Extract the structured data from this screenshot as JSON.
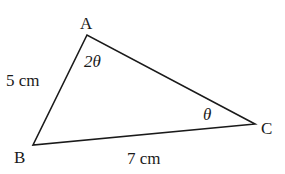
{
  "diagram": {
    "type": "triangle",
    "colors": {
      "stroke": "#1a1a1a",
      "text": "#1a1a1a",
      "background": "#ffffff"
    },
    "vertices": [
      {
        "id": "A",
        "label": "A",
        "x": 87,
        "y": 35
      },
      {
        "id": "B",
        "label": "B",
        "x": 33,
        "y": 145
      },
      {
        "id": "C",
        "label": "C",
        "x": 255,
        "y": 124
      }
    ],
    "sides": [
      {
        "from": "A",
        "to": "B",
        "label": "5 cm"
      },
      {
        "from": "B",
        "to": "C",
        "label": "7 cm"
      },
      {
        "from": "A",
        "to": "C",
        "label": ""
      }
    ],
    "angles": [
      {
        "vertex": "A",
        "label": "2θ"
      },
      {
        "vertex": "C",
        "label": "θ"
      }
    ]
  }
}
